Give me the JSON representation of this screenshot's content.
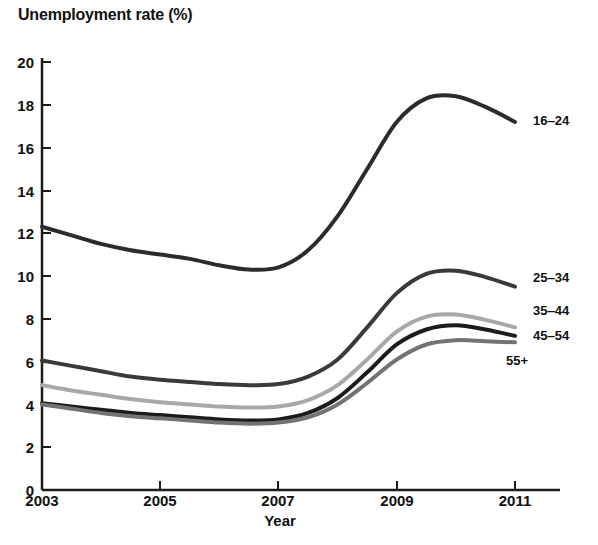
{
  "chart_data": {
    "type": "line",
    "title": "Unemployment rate (%)",
    "xlabel": "Year",
    "ylabel": "",
    "xlim": [
      2003,
      2011
    ],
    "ylim": [
      0,
      20
    ],
    "grid": false,
    "legend_position": "right-inline",
    "x": [
      2003,
      2003.5,
      2004,
      2004.5,
      2005,
      2005.5,
      2006,
      2006.5,
      2007,
      2007.5,
      2008,
      2008.5,
      2009,
      2009.5,
      2010,
      2010.5,
      2011
    ],
    "xticks": [
      2003,
      2005,
      2007,
      2009,
      2011
    ],
    "xticklabels": [
      "2003",
      "2005",
      "2007",
      "2009",
      "2011"
    ],
    "yticks": [
      0,
      2,
      4,
      6,
      8,
      10,
      12,
      14,
      16,
      18,
      20
    ],
    "yticklabels": [
      "0",
      "2",
      "4",
      "6",
      "8",
      "10",
      "12",
      "14",
      "16",
      "18",
      "20"
    ],
    "series": [
      {
        "name": "16‒24",
        "label": "16‒24",
        "color": "#2b2b2b",
        "width": 4,
        "values": [
          12.3,
          11.9,
          11.5,
          11.2,
          11.0,
          10.8,
          10.5,
          10.3,
          10.4,
          11.2,
          12.8,
          15.0,
          17.2,
          18.3,
          18.4,
          17.9,
          17.2
        ]
      },
      {
        "name": "25‒34",
        "label": "25‒34",
        "color": "#3a3a3a",
        "width": 4,
        "values": [
          6.05,
          5.8,
          5.55,
          5.3,
          5.15,
          5.05,
          4.95,
          4.9,
          4.95,
          5.3,
          6.1,
          7.6,
          9.2,
          10.1,
          10.25,
          9.95,
          9.5
        ]
      },
      {
        "name": "35‒44",
        "label": "35‒44",
        "color": "#a8a8a8",
        "width": 4,
        "values": [
          4.9,
          4.65,
          4.45,
          4.25,
          4.1,
          4.0,
          3.9,
          3.85,
          3.9,
          4.2,
          4.9,
          6.1,
          7.4,
          8.1,
          8.2,
          7.95,
          7.6
        ]
      },
      {
        "name": "45‒54",
        "label": "45‒54",
        "color": "#1c1c1c",
        "width": 4,
        "values": [
          4.05,
          3.9,
          3.75,
          3.6,
          3.5,
          3.4,
          3.3,
          3.25,
          3.3,
          3.6,
          4.3,
          5.5,
          6.8,
          7.5,
          7.7,
          7.5,
          7.2
        ]
      },
      {
        "name": "55+",
        "label": "55+",
        "color": "#737373",
        "width": 4,
        "values": [
          4.0,
          3.8,
          3.6,
          3.45,
          3.35,
          3.25,
          3.15,
          3.1,
          3.15,
          3.4,
          4.0,
          5.0,
          6.1,
          6.8,
          7.0,
          6.95,
          6.9
        ]
      }
    ],
    "series_labels": [
      {
        "text": "16‒24",
        "x": 533,
        "y": 120
      },
      {
        "text": "25‒34",
        "x": 533,
        "y": 277
      },
      {
        "text": "35‒44",
        "x": 533,
        "y": 310
      },
      {
        "text": "45‒54",
        "x": 533,
        "y": 335
      },
      {
        "text": "55+",
        "x": 506,
        "y": 360
      }
    ]
  },
  "axes": {
    "title": "Unemployment rate (%)",
    "xlabel": "Year",
    "yticks": [
      {
        "label": "20",
        "top": 62
      },
      {
        "label": "18",
        "top": 105
      },
      {
        "label": "16",
        "top": 148
      },
      {
        "label": "14",
        "top": 191
      },
      {
        "label": "12",
        "top": 233
      },
      {
        "label": "10",
        "top": 276
      },
      {
        "label": "8",
        "top": 319
      },
      {
        "label": "6",
        "top": 362
      },
      {
        "label": "4",
        "top": 405
      },
      {
        "label": "2",
        "top": 447
      },
      {
        "label": "0",
        "top": 490
      }
    ],
    "xticks": [
      {
        "label": "2003",
        "left": 42
      },
      {
        "label": "2005",
        "left": 160
      },
      {
        "label": "2007",
        "left": 278
      },
      {
        "label": "2009",
        "left": 397
      },
      {
        "label": "2011",
        "left": 515
      }
    ]
  }
}
